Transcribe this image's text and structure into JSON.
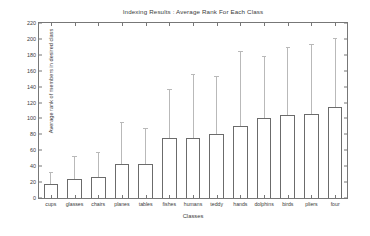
{
  "chart_data": {
    "type": "bar",
    "title": "Indexing Results : Average Rank For Each Class",
    "xlabel": "Classes",
    "ylabel": "Average rank of members in desired class",
    "ylim": [
      0,
      220
    ],
    "ytick_step": 20,
    "yticks": [
      "0",
      "20",
      "40",
      "60",
      "80",
      "100",
      "120",
      "140",
      "160",
      "180",
      "200",
      "220"
    ],
    "grid": false,
    "legend": null,
    "categories": [
      "cups",
      "glasses",
      "chairs",
      "planes",
      "tables",
      "fishes",
      "humans",
      "teddy",
      "hands",
      "dolphins",
      "birds",
      "pliers",
      "four"
    ],
    "values": [
      18,
      24,
      27,
      43,
      43,
      75,
      75,
      80,
      90,
      100,
      104,
      106,
      115
    ],
    "error_low": [
      5,
      2,
      1,
      1,
      1,
      13,
      1,
      9,
      4,
      22,
      18,
      19,
      29
    ],
    "error_high": [
      31,
      51,
      56,
      94,
      87,
      136,
      155,
      152,
      183,
      177,
      188,
      192,
      200
    ],
    "bar_face_color": "#ffffff",
    "bar_edge_color": "#6b6b6b",
    "errorbar_color": "#b9b9b9",
    "axis_color": "#777777",
    "background_color": "#ffffff"
  }
}
